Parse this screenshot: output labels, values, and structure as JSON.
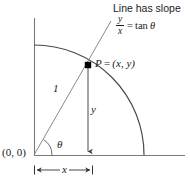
{
  "figure": {
    "kind": "unit-circle-trigonometry-diagram",
    "caption_text": "Line has slope",
    "slope_equation": {
      "numerator": "y",
      "denominator": "x",
      "equals": "=",
      "function": "tan",
      "angle": "θ"
    },
    "point_label": {
      "name": "P",
      "equals": "=",
      "coordinates": "(x, y)"
    },
    "origin_label": "(0, 0)",
    "radius_label": "1",
    "vertical_leg_label": "y",
    "horizontal_leg_label": "x",
    "angle_label": "θ",
    "colors": {
      "stroke": "#555555",
      "axis": "#6b6b6b",
      "text": "#1a1a1a",
      "marker": "#000000",
      "background": "#ffffff"
    },
    "geometry": {
      "origin": [
        34,
        155
      ],
      "radius": 110,
      "point_p": [
        88,
        65
      ],
      "axis_x_end": [
        185,
        155
      ],
      "axis_y_top": [
        34,
        18
      ],
      "arc_start": [
        34,
        45
      ],
      "arc_end": [
        144,
        155
      ],
      "slope_line_end": [
        111,
        21
      ],
      "theta_arc_radius": 18,
      "dimension_line_y": 170,
      "dimension_x_from": 34,
      "dimension_x_to": 93
    }
  }
}
